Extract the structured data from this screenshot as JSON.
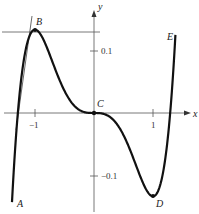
{
  "figure": {
    "axes": {
      "x_label": "x",
      "y_label": "y",
      "x_ticks": [
        {
          "value": -1,
          "label": "−1"
        },
        {
          "value": 1,
          "label": "1"
        }
      ],
      "y_ticks": [
        {
          "value": 0.1,
          "label": "0.1"
        },
        {
          "value": -0.1,
          "label": "−0.1"
        }
      ]
    },
    "points": {
      "A": "A",
      "B": "B",
      "C": "C",
      "D": "D",
      "E": "E"
    },
    "colors": {
      "curve": "#111111",
      "axis": "#555555",
      "tangent": "#444444"
    }
  },
  "chart_data": {
    "type": "line",
    "title": "",
    "xlabel": "x",
    "ylabel": "y",
    "function": "y = 0.2x^5 - (1/3)x^3",
    "xlim": [
      -1.4,
      1.45
    ],
    "ylim": [
      -0.15,
      0.18
    ],
    "labeled_points": [
      {
        "name": "A",
        "x": -1.38,
        "y": -0.15
      },
      {
        "name": "B",
        "x": -1,
        "y": 0.133
      },
      {
        "name": "C",
        "x": 0,
        "y": 0
      },
      {
        "name": "D",
        "x": 1,
        "y": -0.133
      },
      {
        "name": "E",
        "x": 1.42,
        "y": 0.17
      }
    ],
    "annotations": [
      "horizontal tangent line at B",
      "sloped tangent line near B"
    ],
    "grid": false
  }
}
